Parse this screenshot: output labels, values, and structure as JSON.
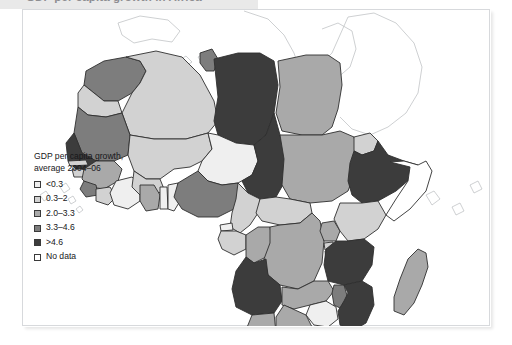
{
  "caption": {
    "text": "GDP per capita growth in Africa"
  },
  "legend": {
    "title_line1": "GDP per capita growth,",
    "title_line2": "average 2004–06",
    "items": [
      {
        "label": "<0.3",
        "color": "#efefef"
      },
      {
        "label": "0.3–2",
        "color": "#d2d2d2"
      },
      {
        "label": "2.0–3.3",
        "color": "#a9a9a9"
      },
      {
        "label": "3.3–4.6",
        "color": "#7d7d7d"
      },
      {
        "label": ">4.6",
        "color": "#3c3c3c"
      },
      {
        "label": "No data",
        "color": "#ffffff"
      }
    ]
  },
  "chart_data": {
    "type": "map",
    "title": "GDP per capita growth in Africa",
    "subtitle": "average 2004–06",
    "unit": "percent per year",
    "bins": [
      {
        "label": "<0.3",
        "min": null,
        "max": 0.3,
        "color": "#efefef"
      },
      {
        "label": "0.3–2",
        "min": 0.3,
        "max": 2.0,
        "color": "#d2d2d2"
      },
      {
        "label": "2.0–3.3",
        "min": 2.0,
        "max": 3.3,
        "color": "#a9a9a9"
      },
      {
        "label": "3.3–4.6",
        "min": 3.3,
        "max": 4.6,
        "color": "#7d7d7d"
      },
      {
        "label": ">4.6",
        "min": 4.6,
        "max": null,
        "color": "#3c3c3c"
      },
      {
        "label": "No data",
        "min": null,
        "max": null,
        "color": "#ffffff"
      }
    ],
    "legend_position": "left",
    "regions": [
      {
        "name": "Morocco",
        "bin": "3.3–4.6"
      },
      {
        "name": "Western Sahara",
        "bin": "0.3–2"
      },
      {
        "name": "Algeria",
        "bin": "0.3–2"
      },
      {
        "name": "Tunisia",
        "bin": "3.3–4.6"
      },
      {
        "name": "Libya",
        "bin": ">4.6"
      },
      {
        "name": "Egypt",
        "bin": "2.0–3.3"
      },
      {
        "name": "Mauritania",
        "bin": "3.3–4.6"
      },
      {
        "name": "Mali",
        "bin": "0.3–2"
      },
      {
        "name": "Niger",
        "bin": "<0.3"
      },
      {
        "name": "Chad",
        "bin": ">4.6"
      },
      {
        "name": "Sudan",
        "bin": "2.0–3.3"
      },
      {
        "name": "Eritrea",
        "bin": "0.3–2"
      },
      {
        "name": "Ethiopia",
        "bin": ">4.6"
      },
      {
        "name": "Djibouti",
        "bin": "0.3–2"
      },
      {
        "name": "Somalia",
        "bin": "No data"
      },
      {
        "name": "Senegal",
        "bin": ">4.6"
      },
      {
        "name": "Gambia",
        "bin": "0.3–2"
      },
      {
        "name": "Guinea-Bissau",
        "bin": "0.3–2"
      },
      {
        "name": "Guinea",
        "bin": "2.0–3.3"
      },
      {
        "name": "Sierra Leone",
        "bin": "3.3–4.6"
      },
      {
        "name": "Liberia",
        "bin": "0.3–2"
      },
      {
        "name": "Ivory Coast",
        "bin": "<0.3"
      },
      {
        "name": "Burkina Faso",
        "bin": "0.3–2"
      },
      {
        "name": "Ghana",
        "bin": "2.0–3.3"
      },
      {
        "name": "Togo",
        "bin": "<0.3"
      },
      {
        "name": "Benin",
        "bin": "<0.3"
      },
      {
        "name": "Nigeria",
        "bin": "3.3–4.6"
      },
      {
        "name": "Cameroon",
        "bin": "0.3–2"
      },
      {
        "name": "Central African Republic",
        "bin": "0.3–2"
      },
      {
        "name": "Equatorial Guinea",
        "bin": "<0.3"
      },
      {
        "name": "Gabon",
        "bin": "0.3–2"
      },
      {
        "name": "Congo",
        "bin": "2.0–3.3"
      },
      {
        "name": "DR Congo",
        "bin": "2.0–3.3"
      },
      {
        "name": "Uganda",
        "bin": "2.0–3.3"
      },
      {
        "name": "Rwanda",
        "bin": "0.3–2"
      },
      {
        "name": "Burundi",
        "bin": "No data"
      },
      {
        "name": "Kenya",
        "bin": "0.3–2"
      },
      {
        "name": "Tanzania",
        "bin": ">4.6"
      },
      {
        "name": "Angola",
        "bin": ">4.6"
      },
      {
        "name": "Zambia",
        "bin": "2.0–3.3"
      },
      {
        "name": "Malawi",
        "bin": "3.3–4.6"
      },
      {
        "name": "Mozambique",
        "bin": ">4.6"
      },
      {
        "name": "Zimbabwe",
        "bin": "<0.3"
      },
      {
        "name": "Botswana",
        "bin": "2.0–3.3"
      },
      {
        "name": "Namibia",
        "bin": "2.0–3.3"
      },
      {
        "name": "South Africa",
        "bin": ">4.6"
      },
      {
        "name": "Lesotho",
        "bin": "2.0–3.3"
      },
      {
        "name": "Swaziland",
        "bin": "2.0–3.3"
      },
      {
        "name": "Madagascar",
        "bin": "2.0–3.3"
      }
    ]
  }
}
